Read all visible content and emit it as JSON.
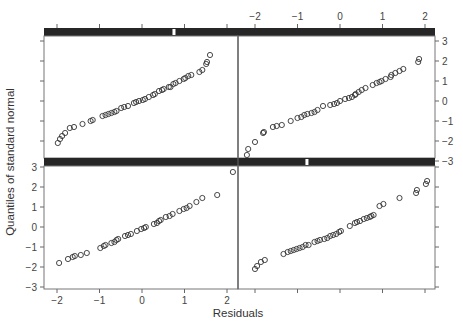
{
  "chart_data": {
    "type": "scatter",
    "title": "",
    "layout": "2x2 trellis (lattice) normal Q-Q plots with strips",
    "xlabel": "Residuals",
    "ylabel": "Quantiles of standard normal",
    "xlim": [
      -2.3,
      2.3
    ],
    "ylim": [
      -3.2,
      3.2
    ],
    "x_ticks": [
      -2,
      -1,
      0,
      1,
      2
    ],
    "y_ticks": [
      -3,
      -2,
      -1,
      0,
      1,
      2,
      3
    ],
    "x_tick_labels": [
      "-2",
      "-1",
      "0",
      "1",
      "2"
    ],
    "y_tick_labels": [
      "-3",
      "-2",
      "-1",
      "0",
      "1",
      "2",
      "3"
    ],
    "grid": false,
    "legend": null,
    "marker": "open circle",
    "panels": [
      {
        "name": "top-left",
        "position": "top-left",
        "strip_marker_fraction": 0.67,
        "points": [
          [
            -1.98,
            -2.1
          ],
          [
            -1.93,
            -1.9
          ],
          [
            -1.88,
            -1.75
          ],
          [
            -1.81,
            -1.6
          ],
          [
            -1.7,
            -1.35
          ],
          [
            -1.6,
            -1.3
          ],
          [
            -1.4,
            -1.15
          ],
          [
            -1.21,
            -1.0
          ],
          [
            -1.16,
            -0.95
          ],
          [
            -0.93,
            -0.75
          ],
          [
            -0.86,
            -0.7
          ],
          [
            -0.79,
            -0.65
          ],
          [
            -0.72,
            -0.6
          ],
          [
            -0.65,
            -0.55
          ],
          [
            -0.6,
            -0.5
          ],
          [
            -0.49,
            -0.35
          ],
          [
            -0.42,
            -0.3
          ],
          [
            -0.33,
            -0.25
          ],
          [
            -0.19,
            -0.1
          ],
          [
            -0.14,
            -0.05
          ],
          [
            -0.07,
            0.0
          ],
          [
            0.02,
            0.05
          ],
          [
            0.07,
            0.1
          ],
          [
            0.16,
            0.2
          ],
          [
            0.26,
            0.3
          ],
          [
            0.3,
            0.35
          ],
          [
            0.4,
            0.5
          ],
          [
            0.47,
            0.55
          ],
          [
            0.51,
            0.6
          ],
          [
            0.63,
            0.7
          ],
          [
            0.67,
            0.7
          ],
          [
            0.74,
            0.85
          ],
          [
            0.79,
            0.9
          ],
          [
            0.88,
            1.0
          ],
          [
            0.98,
            1.1
          ],
          [
            1.02,
            1.15
          ],
          [
            1.09,
            1.25
          ],
          [
            1.16,
            1.3
          ],
          [
            1.35,
            1.45
          ],
          [
            1.42,
            1.55
          ],
          [
            1.51,
            1.85
          ],
          [
            1.53,
            1.95
          ],
          [
            1.6,
            2.3
          ]
        ]
      },
      {
        "name": "top-right",
        "position": "top-right",
        "strip_marker_fraction": null,
        "points": [
          [
            -2.19,
            -2.7
          ],
          [
            -2.16,
            -2.4
          ],
          [
            -2.0,
            -2.05
          ],
          [
            -1.81,
            -1.6
          ],
          [
            -1.79,
            -1.55
          ],
          [
            -1.58,
            -1.3
          ],
          [
            -1.49,
            -1.25
          ],
          [
            -1.37,
            -1.2
          ],
          [
            -1.16,
            -1.0
          ],
          [
            -1.0,
            -0.85
          ],
          [
            -0.91,
            -0.8
          ],
          [
            -0.84,
            -0.7
          ],
          [
            -0.77,
            -0.65
          ],
          [
            -0.67,
            -0.6
          ],
          [
            -0.6,
            -0.55
          ],
          [
            -0.53,
            -0.45
          ],
          [
            -0.4,
            -0.25
          ],
          [
            -0.23,
            -0.2
          ],
          [
            -0.14,
            -0.15
          ],
          [
            -0.07,
            -0.1
          ],
          [
            0.0,
            0.0
          ],
          [
            0.12,
            0.1
          ],
          [
            0.21,
            0.15
          ],
          [
            0.28,
            0.2
          ],
          [
            0.35,
            0.3
          ],
          [
            0.37,
            0.35
          ],
          [
            0.44,
            0.45
          ],
          [
            0.51,
            0.55
          ],
          [
            0.6,
            0.65
          ],
          [
            0.77,
            0.8
          ],
          [
            0.86,
            0.9
          ],
          [
            0.93,
            0.95
          ],
          [
            0.98,
            1.0
          ],
          [
            1.07,
            1.1
          ],
          [
            1.19,
            1.2
          ],
          [
            1.21,
            1.3
          ],
          [
            1.3,
            1.4
          ],
          [
            1.4,
            1.5
          ],
          [
            1.49,
            1.6
          ],
          [
            1.84,
            1.95
          ],
          [
            1.86,
            2.1
          ]
        ]
      },
      {
        "name": "bottom-left",
        "position": "bottom-left",
        "strip_marker_fraction": null,
        "points": [
          [
            -1.95,
            -1.8
          ],
          [
            -1.74,
            -1.6
          ],
          [
            -1.63,
            -1.5
          ],
          [
            -1.58,
            -1.45
          ],
          [
            -1.44,
            -1.4
          ],
          [
            -1.3,
            -1.3
          ],
          [
            -0.98,
            -1.05
          ],
          [
            -0.9,
            -0.95
          ],
          [
            -0.86,
            -0.9
          ],
          [
            -0.72,
            -0.8
          ],
          [
            -0.65,
            -0.75
          ],
          [
            -0.6,
            -0.65
          ],
          [
            -0.56,
            -0.6
          ],
          [
            -0.4,
            -0.45
          ],
          [
            -0.33,
            -0.4
          ],
          [
            -0.26,
            -0.35
          ],
          [
            -0.12,
            -0.2
          ],
          [
            -0.02,
            -0.1
          ],
          [
            0.05,
            -0.05
          ],
          [
            0.09,
            0.0
          ],
          [
            0.28,
            0.15
          ],
          [
            0.35,
            0.2
          ],
          [
            0.4,
            0.3
          ],
          [
            0.44,
            0.35
          ],
          [
            0.56,
            0.5
          ],
          [
            0.65,
            0.55
          ],
          [
            0.72,
            0.65
          ],
          [
            0.88,
            0.8
          ],
          [
            0.98,
            0.9
          ],
          [
            1.05,
            0.95
          ],
          [
            1.12,
            1.05
          ],
          [
            1.28,
            1.25
          ],
          [
            1.42,
            1.45
          ],
          [
            1.77,
            1.6
          ],
          [
            2.14,
            2.75
          ]
        ]
      },
      {
        "name": "bottom-right",
        "position": "bottom-right",
        "strip_marker_fraction": 0.35,
        "points": [
          [
            -2.0,
            -2.1
          ],
          [
            -1.95,
            -1.95
          ],
          [
            -1.86,
            -1.75
          ],
          [
            -1.77,
            -1.65
          ],
          [
            -1.33,
            -1.35
          ],
          [
            -1.23,
            -1.25
          ],
          [
            -1.16,
            -1.2
          ],
          [
            -1.09,
            -1.15
          ],
          [
            -1.02,
            -1.1
          ],
          [
            -0.95,
            -1.05
          ],
          [
            -0.88,
            -1.0
          ],
          [
            -0.81,
            -0.9
          ],
          [
            -0.74,
            -0.9
          ],
          [
            -0.6,
            -0.75
          ],
          [
            -0.53,
            -0.7
          ],
          [
            -0.47,
            -0.65
          ],
          [
            -0.37,
            -0.6
          ],
          [
            -0.3,
            -0.55
          ],
          [
            -0.23,
            -0.45
          ],
          [
            -0.16,
            -0.4
          ],
          [
            -0.09,
            -0.35
          ],
          [
            -0.02,
            -0.25
          ],
          [
            0.02,
            -0.2
          ],
          [
            0.23,
            0.05
          ],
          [
            0.35,
            0.2
          ],
          [
            0.4,
            0.25
          ],
          [
            0.47,
            0.3
          ],
          [
            0.56,
            0.4
          ],
          [
            0.63,
            0.45
          ],
          [
            0.7,
            0.5
          ],
          [
            0.74,
            0.55
          ],
          [
            0.79,
            0.6
          ],
          [
            0.93,
            1.05
          ],
          [
            1.02,
            1.15
          ],
          [
            1.4,
            1.45
          ],
          [
            1.79,
            1.7
          ],
          [
            1.81,
            1.85
          ],
          [
            2.02,
            2.15
          ],
          [
            2.05,
            2.3
          ]
        ]
      }
    ]
  },
  "axes": {
    "x_title": "Residuals",
    "y_title": "Quantiles of standard normal",
    "top_x_tick_labels": [
      "-2",
      "-1",
      "0",
      "1",
      "2"
    ],
    "bottom_x_tick_labels": [
      "-2",
      "-1",
      "0",
      "1",
      "2"
    ],
    "left_y_tick_labels": [
      "3",
      "2",
      "1",
      "0",
      "-1",
      "-2",
      "-3"
    ],
    "right_y_tick_labels": [
      "3",
      "2",
      "1",
      "0",
      "-1",
      "-2",
      "-3"
    ]
  }
}
